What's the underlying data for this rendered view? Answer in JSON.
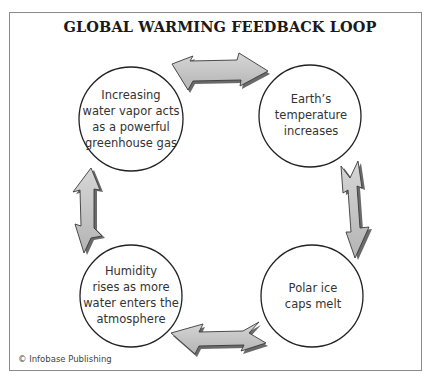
{
  "title": "GLOBAL WARMING FEEDBACK LOOP",
  "nodes": [
    {
      "id": "water-vapor",
      "label": "Increasing water vapor acts as a powerful greenhouse gas",
      "lines": [
        "Increasing",
        "water vapor acts",
        "as a powerful",
        "greenhouse gas"
      ]
    },
    {
      "id": "temperature",
      "label": "Earth's temperature increases",
      "lines": [
        "Earth’s",
        "temperature",
        "increases"
      ]
    },
    {
      "id": "ice-caps",
      "label": "Polar ice caps melt",
      "lines": [
        "Polar ice",
        "caps melt"
      ]
    },
    {
      "id": "humidity",
      "label": "Humidity rises as more water enters the atmosphere",
      "lines": [
        "Humidity",
        "rises as more",
        "water enters the",
        "atmosphere"
      ]
    }
  ],
  "edges": [
    {
      "from": "water-vapor",
      "to": "temperature",
      "style": "double-headed arrow"
    },
    {
      "from": "temperature",
      "to": "ice-caps",
      "style": "double-headed arrow"
    },
    {
      "from": "ice-caps",
      "to": "humidity",
      "style": "double-headed arrow"
    },
    {
      "from": "humidity",
      "to": "water-vapor",
      "style": "double-headed arrow"
    }
  ],
  "credit": "© Infobase Publishing",
  "colors": {
    "arrow_fill": "#c8c8c8",
    "arrow_shadow": "#6a6a6a",
    "arrow_stroke": "#3a3a3a",
    "circle_stroke": "#222222",
    "frame": "#8a8a8a"
  }
}
